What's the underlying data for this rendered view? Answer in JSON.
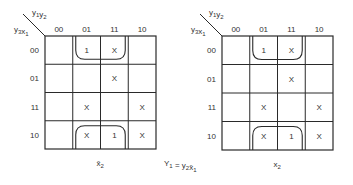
{
  "diagram": {
    "type": "karnaugh-map",
    "equation": {
      "lhs": "Y",
      "lhs_sub": "1",
      "eq": "=",
      "rhs": [
        {
          "v": "y",
          "sub": "2"
        },
        {
          "v": "x̄",
          "sub": "1"
        }
      ]
    },
    "maps": [
      {
        "id": "map-x2-bar",
        "corner_top": {
          "a": "y",
          "a_sub": "1",
          "b": "y",
          "b_sub": "2"
        },
        "corner_left": {
          "a": "y",
          "a_sub": "3",
          "b": "x",
          "b_sub": "1"
        },
        "col_headers": [
          "00",
          "01",
          "11",
          "10"
        ],
        "row_headers": [
          "00",
          "01",
          "11",
          "10"
        ],
        "cells": [
          [
            "",
            "1",
            "X",
            ""
          ],
          [
            "",
            "",
            "X",
            ""
          ],
          [
            "",
            "X",
            "",
            "X"
          ],
          [
            "",
            "X",
            "1",
            "X"
          ]
        ],
        "caption": {
          "v": "x̄",
          "sub": "2"
        }
      },
      {
        "id": "map-x2",
        "corner_top": {
          "a": "y",
          "a_sub": "1",
          "b": "y",
          "b_sub": "2"
        },
        "corner_left": {
          "a": "y",
          "a_sub": "3",
          "b": "x",
          "b_sub": "1"
        },
        "col_headers": [
          "00",
          "01",
          "11",
          "10"
        ],
        "row_headers": [
          "00",
          "01",
          "11",
          "10"
        ],
        "cells": [
          [
            "",
            "1",
            "X",
            ""
          ],
          [
            "",
            "",
            "X",
            ""
          ],
          [
            "",
            "X",
            "",
            "X"
          ],
          [
            "",
            "X",
            "1",
            "X"
          ]
        ],
        "caption": {
          "v": "x",
          "sub": "2"
        }
      }
    ]
  }
}
